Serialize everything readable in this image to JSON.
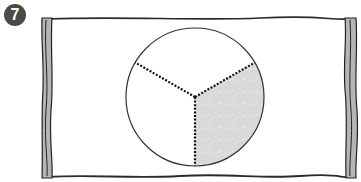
{
  "figure": {
    "number_badge": "7",
    "circle": {
      "parts": 3,
      "shaded_parts": 1
    },
    "colors": {
      "badge_bg": "#4a4a4a",
      "badge_text": "#ffffff",
      "frame_rod": "#b5b5b5",
      "outline": "#222222",
      "shade": "#d9d9d9",
      "panel": "#ffffff"
    }
  }
}
